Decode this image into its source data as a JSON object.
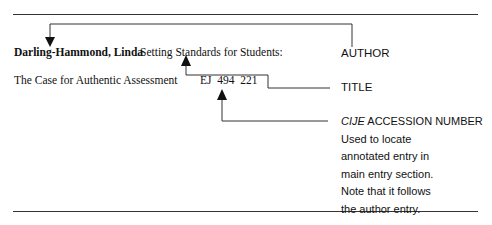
{
  "entry": {
    "author": "Darling-Hammond, Linda",
    "title_line1": "Setting Standards for Students:",
    "title_line2": "The Case for Authentic Assessment",
    "accession_number": "EJ  494  221"
  },
  "labels": {
    "author": "AUTHOR",
    "title": "TITLE",
    "accession_prefix": "CIJE",
    "accession_suffix": " ACCESSION NUMBER",
    "accession_note": [
      "Used to locate",
      "annotated entry in",
      "main entry section.",
      "Note that it follows",
      "the author entry."
    ]
  },
  "colors": {
    "line": "#333333",
    "text": "#111111"
  }
}
